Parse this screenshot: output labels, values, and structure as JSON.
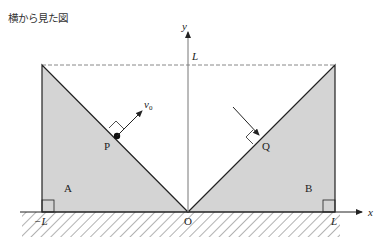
{
  "title": "横から見た図",
  "axes": {
    "x_label": "x",
    "y_label": "y"
  },
  "ticks": {
    "neg_L": "−L",
    "pos_L": "L",
    "origin": "O",
    "top_L": "L"
  },
  "blocks": {
    "left": "A",
    "right": "B"
  },
  "points": {
    "p": "P",
    "q": "Q"
  },
  "velocity": {
    "label": "v",
    "subscript": "0"
  },
  "colors": {
    "block_fill": "#d4d4d4",
    "line": "#222222",
    "dashed": "#888888"
  }
}
